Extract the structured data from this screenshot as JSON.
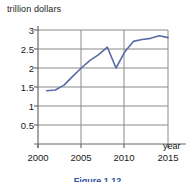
{
  "chart_data": {
    "type": "line",
    "title": "",
    "subtitle": "",
    "xlabel": "year",
    "ylabel": "trillion dollars",
    "xlim": [
      2000,
      2016
    ],
    "ylim": [
      0,
      3
    ],
    "grid": true,
    "legend": null,
    "x_tick_labels": [
      "2000",
      "2005",
      "2010",
      "2015"
    ],
    "x_tick_values": [
      2000,
      2005,
      2010,
      2015
    ],
    "y_tick_labels": [
      "0.5",
      "1",
      "1.5",
      "2",
      "2.5",
      "3"
    ],
    "y_tick_values": [
      0.5,
      1,
      1.5,
      2,
      2.5,
      3
    ],
    "line_color": "#5a6ba8",
    "grid_color": "#8a8a8a",
    "axis_color": "#6b6b6b",
    "series": [
      {
        "name": "trillion dollars",
        "x": [
          2001,
          2002,
          2003,
          2004,
          2005,
          2006,
          2007,
          2008,
          2009,
          2010,
          2011,
          2012,
          2013,
          2014,
          2015
        ],
        "values": [
          1.4,
          1.42,
          1.55,
          1.78,
          2.0,
          2.2,
          2.35,
          2.55,
          2.0,
          2.42,
          2.7,
          2.75,
          2.78,
          2.85,
          2.8
        ]
      }
    ]
  },
  "axis_labels": {
    "y_axis_title": "trillion dollars",
    "x_axis_title": "year"
  },
  "caption": {
    "text": "Figure 1.12"
  }
}
